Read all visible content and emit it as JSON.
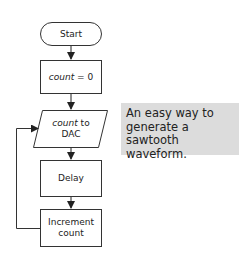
{
  "flowchart": {
    "nodes": [
      {
        "id": "start",
        "shape": "terminal",
        "label": "Start"
      },
      {
        "id": "init",
        "shape": "process",
        "label_var": "count",
        "label_rest": " = 0"
      },
      {
        "id": "output",
        "shape": "io",
        "label_var": "count",
        "label_rest": " to DAC"
      },
      {
        "id": "delay",
        "shape": "process",
        "label": "Delay"
      },
      {
        "id": "increment",
        "shape": "process",
        "label": "Increment count"
      }
    ],
    "edges": [
      {
        "from": "start",
        "to": "init"
      },
      {
        "from": "init",
        "to": "output"
      },
      {
        "from": "output",
        "to": "delay"
      },
      {
        "from": "delay",
        "to": "increment"
      },
      {
        "from": "increment",
        "to": "output",
        "type": "loop-back"
      }
    ]
  },
  "note": {
    "text": "An easy way to generate a sawtooth waveform.",
    "background": "#dcdcdc"
  },
  "colors": {
    "stroke": "#333333",
    "background": "#ffffff"
  }
}
